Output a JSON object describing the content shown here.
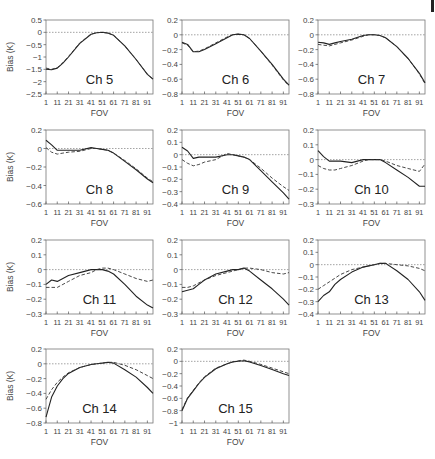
{
  "figure": {
    "x_label": "FOV",
    "y_label": "Bias (K)",
    "x_ticks": [
      "1",
      "11",
      "21",
      "31",
      "41",
      "51",
      "61",
      "71",
      "81",
      "91"
    ]
  },
  "chart_data": [
    {
      "type": "line",
      "title": "Ch 5",
      "xlabel": "FOV",
      "ylabel": "Bias (K)",
      "ylim": [
        -2.5,
        0.5
      ],
      "yticks": [
        0.5,
        0,
        -0.5,
        -1,
        -1.5,
        -2,
        -2.5
      ],
      "yticklabels": [
        "0.5",
        "0",
        "−0.5",
        "−1",
        "−1.5",
        "−2",
        "−2.5"
      ],
      "x": [
        1,
        6,
        11,
        16,
        21,
        31,
        41,
        46,
        51,
        56,
        61,
        71,
        81,
        91,
        96
      ],
      "series": [
        {
          "name": "solid",
          "values": [
            -1.5,
            -1.52,
            -1.45,
            -1.25,
            -1.0,
            -0.45,
            -0.08,
            -0.02,
            0.0,
            -0.03,
            -0.12,
            -0.55,
            -1.1,
            -1.7,
            -1.9
          ]
        },
        {
          "name": "dashed",
          "values": [
            -1.45,
            -1.5,
            -1.43,
            -1.23,
            -0.98,
            -0.43,
            -0.07,
            -0.02,
            0.0,
            -0.03,
            -0.12,
            -0.55,
            -1.1,
            -1.7,
            -1.9
          ]
        }
      ]
    },
    {
      "type": "line",
      "title": "Ch 6",
      "xlabel": "FOV",
      "ylabel": "",
      "ylim": [
        -0.8,
        0.2
      ],
      "yticks": [
        0.2,
        0,
        -0.2,
        -0.4,
        -0.6,
        -0.8
      ],
      "yticklabels": [
        "0.2",
        "0",
        "−0.2",
        "−0.4",
        "−0.6",
        "−0.8"
      ],
      "x": [
        1,
        6,
        11,
        16,
        21,
        31,
        41,
        46,
        51,
        56,
        61,
        71,
        81,
        91,
        96
      ],
      "series": [
        {
          "name": "solid",
          "values": [
            -0.1,
            -0.13,
            -0.23,
            -0.23,
            -0.2,
            -0.12,
            -0.04,
            0.0,
            0.01,
            0.0,
            -0.05,
            -0.22,
            -0.4,
            -0.6,
            -0.68
          ]
        },
        {
          "name": "dashed",
          "values": [
            -0.11,
            -0.14,
            -0.23,
            -0.22,
            -0.19,
            -0.11,
            -0.03,
            0.0,
            0.01,
            0.0,
            -0.05,
            -0.22,
            -0.41,
            -0.61,
            -0.69
          ]
        }
      ]
    },
    {
      "type": "line",
      "title": "Ch 7",
      "xlabel": "FOV",
      "ylabel": "",
      "ylim": [
        -0.8,
        0.2
      ],
      "yticks": [
        0.2,
        0,
        -0.2,
        -0.4,
        -0.6,
        -0.8
      ],
      "yticklabels": [
        "0.2",
        "0",
        "−0.2",
        "−0.4",
        "−0.6",
        "−0.8"
      ],
      "x": [
        1,
        6,
        11,
        16,
        21,
        31,
        41,
        46,
        51,
        56,
        61,
        71,
        81,
        91,
        96
      ],
      "series": [
        {
          "name": "solid",
          "values": [
            -0.1,
            -0.11,
            -0.13,
            -0.11,
            -0.09,
            -0.06,
            -0.01,
            0.0,
            0.0,
            -0.01,
            -0.04,
            -0.16,
            -0.32,
            -0.52,
            -0.65
          ]
        },
        {
          "name": "dashed",
          "values": [
            -0.13,
            -0.14,
            -0.15,
            -0.13,
            -0.11,
            -0.07,
            -0.02,
            0.0,
            0.0,
            -0.01,
            -0.04,
            -0.16,
            -0.32,
            -0.53,
            -0.66
          ]
        }
      ]
    },
    {
      "type": "line",
      "title": "Ch 8",
      "xlabel": "FOV",
      "ylabel": "Bias (K)",
      "ylim": [
        -0.6,
        0.2
      ],
      "yticks": [
        0.2,
        0,
        -0.2,
        -0.4,
        -0.6
      ],
      "yticklabels": [
        "0.2",
        "0",
        "−0.2",
        "−0.4",
        "−0.6"
      ],
      "x": [
        1,
        6,
        11,
        16,
        21,
        31,
        41,
        46,
        51,
        56,
        61,
        71,
        81,
        91,
        96
      ],
      "series": [
        {
          "name": "solid",
          "values": [
            0.09,
            0.04,
            -0.02,
            -0.02,
            -0.02,
            -0.02,
            0.01,
            0.0,
            -0.01,
            -0.02,
            -0.05,
            -0.14,
            -0.23,
            -0.33,
            -0.37
          ]
        },
        {
          "name": "dashed",
          "values": [
            0.01,
            -0.04,
            -0.06,
            -0.05,
            -0.04,
            -0.03,
            0.0,
            0.0,
            -0.01,
            -0.02,
            -0.05,
            -0.13,
            -0.22,
            -0.32,
            -0.36
          ]
        }
      ]
    },
    {
      "type": "line",
      "title": "Ch 9",
      "xlabel": "FOV",
      "ylabel": "",
      "ylim": [
        -0.4,
        0.2
      ],
      "yticks": [
        0.2,
        0.1,
        0,
        -0.1,
        -0.2,
        -0.3,
        -0.4
      ],
      "yticklabels": [
        "0.2",
        "0.1",
        "0",
        "−0.1",
        "−0.2",
        "−0.3",
        "−0.4"
      ],
      "x": [
        1,
        6,
        11,
        16,
        21,
        31,
        41,
        46,
        51,
        56,
        61,
        71,
        81,
        91,
        96
      ],
      "series": [
        {
          "name": "solid",
          "values": [
            0.06,
            0.03,
            -0.03,
            -0.02,
            -0.02,
            -0.02,
            0.0,
            0.0,
            -0.01,
            -0.02,
            -0.04,
            -0.13,
            -0.22,
            -0.31,
            -0.36
          ]
        },
        {
          "name": "dashed",
          "values": [
            -0.04,
            -0.07,
            -0.09,
            -0.08,
            -0.06,
            -0.04,
            0.01,
            0.0,
            -0.01,
            -0.02,
            -0.04,
            -0.11,
            -0.19,
            -0.26,
            -0.29
          ]
        }
      ]
    },
    {
      "type": "line",
      "title": "Ch 10",
      "xlabel": "FOV",
      "ylabel": "",
      "ylim": [
        -0.3,
        0.2
      ],
      "yticks": [
        0.2,
        0.1,
        0,
        -0.1,
        -0.2,
        -0.3
      ],
      "yticklabels": [
        "0.2",
        "0.1",
        "0",
        "−0.1",
        "−0.2",
        "−0.3"
      ],
      "x": [
        1,
        6,
        11,
        16,
        21,
        31,
        41,
        46,
        51,
        56,
        61,
        71,
        81,
        91,
        96
      ],
      "series": [
        {
          "name": "solid",
          "values": [
            0.06,
            0.02,
            -0.01,
            -0.01,
            -0.01,
            -0.02,
            0.0,
            0.0,
            0.0,
            0.0,
            -0.02,
            -0.07,
            -0.12,
            -0.18,
            -0.18
          ]
        },
        {
          "name": "dashed",
          "values": [
            -0.04,
            -0.06,
            -0.07,
            -0.07,
            -0.06,
            -0.04,
            -0.01,
            0.0,
            0.0,
            0.0,
            -0.01,
            -0.04,
            -0.06,
            -0.08,
            -0.03
          ]
        }
      ]
    },
    {
      "type": "line",
      "title": "Ch 11",
      "xlabel": "FOV",
      "ylabel": "Bias (K)",
      "ylim": [
        -0.3,
        0.2
      ],
      "yticks": [
        0.2,
        0.1,
        0,
        -0.1,
        -0.2,
        -0.3
      ],
      "yticklabels": [
        "0.2",
        "0.1",
        "0",
        "−0.1",
        "−0.2",
        "−0.3"
      ],
      "x": [
        1,
        6,
        11,
        16,
        21,
        31,
        41,
        46,
        51,
        56,
        61,
        71,
        81,
        91,
        96
      ],
      "series": [
        {
          "name": "solid",
          "values": [
            -0.1,
            -0.07,
            -0.08,
            -0.06,
            -0.04,
            -0.02,
            0.0,
            0.0,
            0.0,
            -0.01,
            -0.03,
            -0.1,
            -0.18,
            -0.24,
            -0.26
          ]
        },
        {
          "name": "dashed",
          "values": [
            -0.12,
            -0.12,
            -0.12,
            -0.1,
            -0.08,
            -0.04,
            -0.02,
            0.0,
            0.01,
            0.01,
            0.0,
            -0.03,
            -0.06,
            -0.08,
            -0.07
          ]
        }
      ]
    },
    {
      "type": "line",
      "title": "Ch 12",
      "xlabel": "FOV",
      "ylabel": "",
      "ylim": [
        -0.3,
        0.2
      ],
      "yticks": [
        0.2,
        0.1,
        0,
        -0.1,
        -0.2,
        -0.3
      ],
      "yticklabels": [
        "0.2",
        "0.1",
        "0",
        "−0.1",
        "−0.2",
        "−0.3"
      ],
      "x": [
        1,
        6,
        11,
        16,
        21,
        31,
        41,
        46,
        51,
        56,
        61,
        71,
        81,
        91,
        96
      ],
      "series": [
        {
          "name": "solid",
          "values": [
            -0.15,
            -0.14,
            -0.13,
            -0.1,
            -0.07,
            -0.03,
            -0.01,
            0.0,
            0.0,
            0.01,
            -0.01,
            -0.07,
            -0.13,
            -0.2,
            -0.24
          ]
        },
        {
          "name": "dashed",
          "values": [
            -0.12,
            -0.12,
            -0.11,
            -0.09,
            -0.07,
            -0.04,
            -0.02,
            -0.01,
            0.0,
            0.01,
            0.01,
            0.0,
            -0.02,
            -0.03,
            -0.02
          ]
        }
      ]
    },
    {
      "type": "line",
      "title": "Ch 13",
      "xlabel": "FOV",
      "ylabel": "",
      "ylim": [
        -0.4,
        0.2
      ],
      "yticks": [
        0.2,
        0.1,
        0,
        -0.1,
        -0.2,
        -0.3,
        -0.4
      ],
      "yticklabels": [
        "0.2",
        "0.1",
        "0",
        "−0.1",
        "−0.2",
        "−0.3",
        "−0.4"
      ],
      "x": [
        1,
        6,
        11,
        16,
        21,
        31,
        41,
        46,
        51,
        56,
        61,
        71,
        81,
        91,
        96
      ],
      "series": [
        {
          "name": "solid",
          "values": [
            -0.3,
            -0.25,
            -0.22,
            -0.16,
            -0.12,
            -0.06,
            -0.02,
            -0.01,
            0.0,
            0.01,
            0.01,
            -0.05,
            -0.12,
            -0.22,
            -0.29
          ]
        },
        {
          "name": "dashed",
          "values": [
            -0.2,
            -0.17,
            -0.14,
            -0.11,
            -0.08,
            -0.04,
            -0.02,
            -0.01,
            0.0,
            0.01,
            0.01,
            0.0,
            -0.01,
            -0.03,
            -0.05
          ]
        }
      ]
    },
    {
      "type": "line",
      "title": "Ch 14",
      "xlabel": "FOV",
      "ylabel": "Bias (K)",
      "ylim": [
        -0.8,
        0.2
      ],
      "yticks": [
        0.2,
        0,
        -0.2,
        -0.4,
        -0.6,
        -0.8
      ],
      "yticklabels": [
        "0.2",
        "0",
        "−0.2",
        "−0.4",
        "−0.6",
        "−0.8"
      ],
      "x": [
        1,
        6,
        11,
        16,
        21,
        31,
        41,
        46,
        51,
        56,
        61,
        71,
        81,
        91,
        96
      ],
      "series": [
        {
          "name": "solid",
          "values": [
            -0.72,
            -0.45,
            -0.3,
            -0.2,
            -0.13,
            -0.05,
            -0.01,
            0.0,
            0.01,
            0.02,
            0.01,
            -0.08,
            -0.18,
            -0.32,
            -0.4
          ]
        },
        {
          "name": "dashed",
          "values": [
            -0.48,
            -0.35,
            -0.25,
            -0.18,
            -0.12,
            -0.05,
            -0.01,
            0.0,
            0.01,
            0.02,
            0.02,
            -0.02,
            -0.08,
            -0.16,
            -0.2
          ]
        }
      ]
    },
    {
      "type": "line",
      "title": "Ch 15",
      "xlabel": "FOV",
      "ylabel": "",
      "ylim": [
        -1,
        0.2
      ],
      "yticks": [
        0.2,
        0,
        -0.2,
        -0.4,
        -0.6,
        -0.8,
        -1
      ],
      "yticklabels": [
        "0.2",
        "0",
        "−0.2",
        "−0.4",
        "−0.6",
        "−0.8",
        "−1"
      ],
      "x": [
        1,
        6,
        11,
        16,
        21,
        31,
        41,
        46,
        51,
        56,
        61,
        71,
        81,
        91,
        96
      ],
      "series": [
        {
          "name": "solid",
          "values": [
            -0.8,
            -0.6,
            -0.48,
            -0.36,
            -0.26,
            -0.12,
            -0.04,
            -0.01,
            0.0,
            0.01,
            -0.01,
            -0.07,
            -0.13,
            -0.2,
            -0.23
          ]
        },
        {
          "name": "dashed",
          "values": [
            -0.78,
            -0.59,
            -0.47,
            -0.35,
            -0.25,
            -0.11,
            -0.04,
            -0.01,
            0.01,
            0.02,
            0.0,
            -0.05,
            -0.11,
            -0.17,
            -0.2
          ]
        }
      ]
    }
  ]
}
